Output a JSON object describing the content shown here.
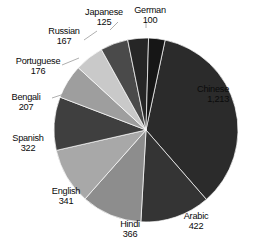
{
  "chart_data": {
    "type": "pie",
    "title": "",
    "subtitle": "",
    "xlabel": "",
    "ylabel": "",
    "legend_position": "none",
    "grid": false,
    "total": 3439,
    "value_unit": "millions of native speakers",
    "categories": [
      "Chinese",
      "Arabic",
      "Hindi",
      "English",
      "Spanish",
      "Bengali",
      "Portuguese",
      "Russian",
      "Japanese",
      "German"
    ],
    "values": [
      1213,
      422,
      366,
      341,
      322,
      207,
      176,
      167,
      125,
      100
    ],
    "value_labels": [
      "1,213",
      "422",
      "366",
      "341",
      "322",
      "207",
      "176",
      "167",
      "125",
      "100"
    ],
    "slice_colors": [
      "#2b2b2b",
      "#343434",
      "#8d8d8d",
      "#a8a8a8",
      "#3f3f3f",
      "#9e9e9e",
      "#c9c9c9",
      "#4a4a4a",
      "#262626",
      "#161616"
    ],
    "slices": [
      {
        "name": "Chinese",
        "value": 1213,
        "label": "1,213",
        "color": "#2b2b2b",
        "start_deg": 12,
        "end_deg": 139.0,
        "label_x": 229,
        "label_y": 84,
        "align": "right",
        "leader": false
      },
      {
        "name": "Arabic",
        "value": 422,
        "label": "422",
        "color": "#343434",
        "start_deg": 139.0,
        "end_deg": 183.2,
        "label_x": 196,
        "label_y": 211,
        "align": "center",
        "leader": false
      },
      {
        "name": "Hindi",
        "value": 366,
        "label": "366",
        "color": "#8d8d8d",
        "start_deg": 183.2,
        "end_deg": 221.5,
        "label_x": 130,
        "label_y": 219,
        "align": "center",
        "leader": false
      },
      {
        "name": "English",
        "value": 341,
        "label": "341",
        "color": "#a8a8a8",
        "start_deg": 221.5,
        "end_deg": 257.2,
        "label_x": 66,
        "label_y": 186,
        "align": "center",
        "leader": false
      },
      {
        "name": "Spanish",
        "value": 322,
        "label": "322",
        "color": "#3f3f3f",
        "start_deg": 257.2,
        "end_deg": 290.9,
        "label_x": 28,
        "label_y": 133,
        "align": "center",
        "leader": false
      },
      {
        "name": "Bengali",
        "value": 207,
        "label": "207",
        "color": "#9e9e9e",
        "start_deg": 290.9,
        "end_deg": 312.6,
        "label_x": 26,
        "label_y": 92,
        "align": "center",
        "leader": true,
        "leader_x1": 52,
        "leader_y1": 98,
        "leader_x2": 67,
        "leader_y2": 93
      },
      {
        "name": "Portuguese",
        "value": 176,
        "label": "176",
        "color": "#c9c9c9",
        "start_deg": 312.6,
        "end_deg": 331.0,
        "label_x": 38,
        "label_y": 56,
        "align": "center",
        "leader": true,
        "leader_x1": 62,
        "leader_y1": 65,
        "leader_x2": 79,
        "leader_y2": 58
      },
      {
        "name": "Russian",
        "value": 167,
        "label": "167",
        "color": "#4a4a4a",
        "start_deg": 331.0,
        "end_deg": 348.5,
        "label_x": 64,
        "label_y": 26,
        "align": "center",
        "leader": true,
        "leader_x1": 84,
        "leader_y1": 40,
        "leader_x2": 97,
        "leader_y2": 31
      },
      {
        "name": "Japanese",
        "value": 125,
        "label": "125",
        "color": "#262626",
        "start_deg": 348.5,
        "end_deg": 361.6,
        "label_x": 104,
        "label_y": 7,
        "align": "center",
        "leader": true,
        "leader_x1": 110,
        "leader_y1": 30,
        "leader_x2": 118,
        "leader_y2": 22
      },
      {
        "name": "German",
        "value": 100,
        "label": "100",
        "color": "#161616",
        "start_deg": 1.6,
        "end_deg": 12.0,
        "label_x": 150,
        "label_y": 5,
        "align": "center",
        "leader": true,
        "leader_x1": 146,
        "leader_y1": 28,
        "leader_x2": 146,
        "leader_y2": 22
      }
    ],
    "geometry": {
      "center_x": 146,
      "center_y": 130,
      "radius": 92
    },
    "background_color": "#ffffff"
  }
}
